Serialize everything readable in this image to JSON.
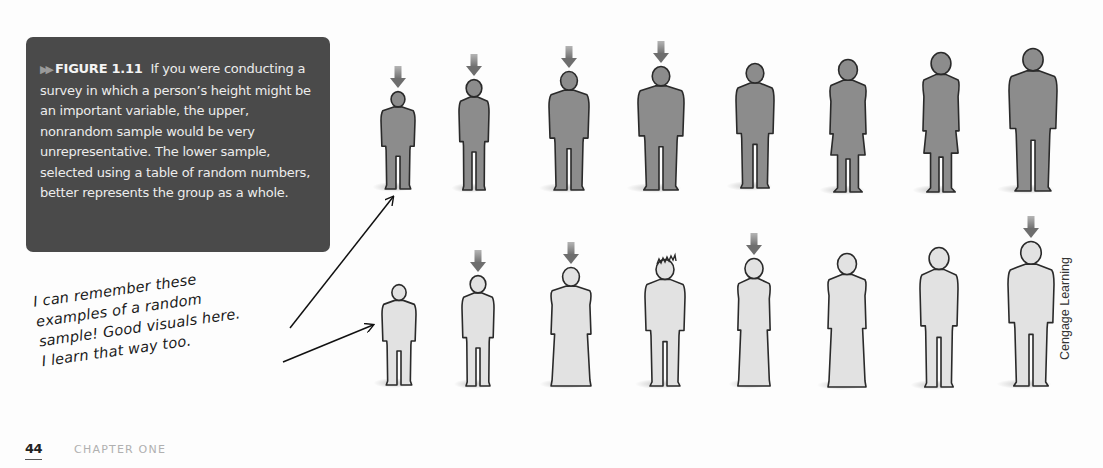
{
  "caption": {
    "marker": "▶▶",
    "label": "FIGURE 1.11",
    "text": "If you were conducting a survey in which a person’s height might be an important variable, the upper, nonrandom sample would be very unrepresentative. The lower sample, selected using a table of random numbers, better represents the group as a whole."
  },
  "handwritten_note": {
    "lines": [
      "I can remember these",
      "examples of a random",
      "sample! Good visuals here.",
      "I learn that way too."
    ]
  },
  "credit": "Cengage Learning",
  "footer": {
    "page_number": "44",
    "chapter": "CHAPTER ONE"
  },
  "colors": {
    "caption_bg": "#4a4a4a",
    "upper_fill": "#8c8c8c",
    "lower_fill": "#e2e2e2",
    "outline": "#2a2a2a",
    "selection_arrow": "#6e6e6e"
  },
  "figures": {
    "upper_row": {
      "label": "nonrandom sample",
      "people": [
        {
          "cx": 398,
          "top": 92,
          "bottom": 189,
          "w": 34,
          "shape": "man",
          "selected": true
        },
        {
          "cx": 474,
          "top": 80,
          "bottom": 190,
          "w": 30,
          "shape": "girl",
          "selected": true
        },
        {
          "cx": 569,
          "top": 72,
          "bottom": 190,
          "w": 40,
          "shape": "man",
          "selected": true
        },
        {
          "cx": 661,
          "top": 67,
          "bottom": 190,
          "w": 46,
          "shape": "man",
          "selected": true
        },
        {
          "cx": 755,
          "top": 64,
          "bottom": 188,
          "w": 38,
          "shape": "woman",
          "selected": false
        },
        {
          "cx": 848,
          "top": 60,
          "bottom": 192,
          "w": 38,
          "shape": "dress",
          "selected": false
        },
        {
          "cx": 941,
          "top": 53,
          "bottom": 192,
          "w": 38,
          "shape": "dress",
          "selected": false
        },
        {
          "cx": 1033,
          "top": 49,
          "bottom": 191,
          "w": 48,
          "shape": "man",
          "selected": false
        }
      ]
    },
    "lower_row": {
      "label": "random sample",
      "people": [
        {
          "cx": 399,
          "top": 285,
          "bottom": 385,
          "w": 34,
          "shape": "man",
          "selected": false
        },
        {
          "cx": 478,
          "top": 276,
          "bottom": 386,
          "w": 32,
          "shape": "woman",
          "selected": true
        },
        {
          "cx": 571,
          "top": 268,
          "bottom": 386,
          "w": 42,
          "shape": "gown",
          "selected": true
        },
        {
          "cx": 665,
          "top": 260,
          "bottom": 386,
          "w": 40,
          "shape": "spiky",
          "selected": false
        },
        {
          "cx": 754,
          "top": 259,
          "bottom": 386,
          "w": 34,
          "shape": "gown",
          "selected": true
        },
        {
          "cx": 847,
          "top": 254,
          "bottom": 387,
          "w": 40,
          "shape": "gown",
          "selected": false
        },
        {
          "cx": 939,
          "top": 248,
          "bottom": 387,
          "w": 38,
          "shape": "woman",
          "selected": false
        },
        {
          "cx": 1031,
          "top": 242,
          "bottom": 386,
          "w": 46,
          "shape": "man",
          "selected": true
        }
      ]
    }
  },
  "pointer_arrows": [
    {
      "x1": 290,
      "y1": 328,
      "x2": 393,
      "y2": 197
    },
    {
      "x1": 283,
      "y1": 362,
      "x2": 373,
      "y2": 325
    }
  ]
}
